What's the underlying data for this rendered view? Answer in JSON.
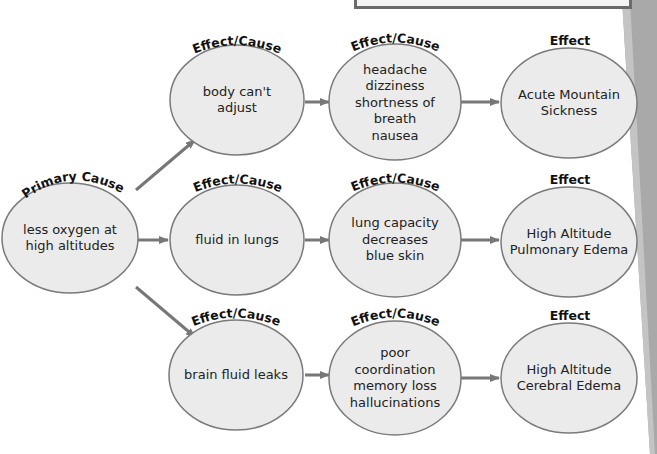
{
  "colors": {
    "node_fill": "#ebebeb",
    "node_stroke": "#7a7a7a",
    "arrow": "#777777",
    "side_strip": "#a9a9a9"
  },
  "diagram": {
    "primary": {
      "label": "Primary Cause",
      "text": "less oxygen at\nhigh altitudes"
    },
    "rows": [
      {
        "step1": {
          "label": "Effect/Cause",
          "text": "body can't\nadjust"
        },
        "step2": {
          "label": "Effect/Cause",
          "text": "headache\ndizziness\nshortness of\nbreath\nnausea"
        },
        "effect": {
          "label": "Effect",
          "text": "Acute Mountain\nSickness"
        }
      },
      {
        "step1": {
          "label": "Effect/Cause",
          "text": "fluid in lungs"
        },
        "step2": {
          "label": "Effect/Cause",
          "text": "lung capacity\ndecreases\nblue skin"
        },
        "effect": {
          "label": "Effect",
          "text": "High Altitude\nPulmonary Edema"
        }
      },
      {
        "step1": {
          "label": "Effect/Cause",
          "text": "brain fluid leaks"
        },
        "step2": {
          "label": "Effect/Cause",
          "text": "poor\ncoordination\nmemory loss\nhallucinations"
        },
        "effect": {
          "label": "Effect",
          "text": "High Altitude\nCerebral Edema"
        }
      }
    ]
  }
}
